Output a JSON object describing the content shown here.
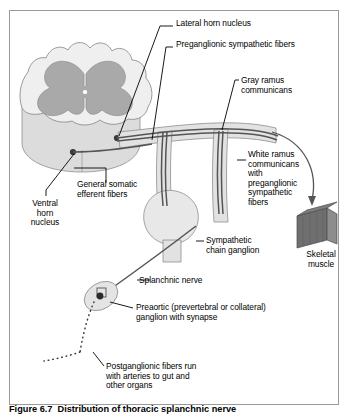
{
  "figure": {
    "caption": "Figure 6.7  Distribution of thoracic splanchnic nerve",
    "border_color": "#9a9a9a",
    "background_color": "#ffffff"
  },
  "colors": {
    "white_matter": "#efefef",
    "gray_matter": "#a9a9a9",
    "cord_side": "#dcdcdc",
    "nerve_trunk": "#e2e2e2",
    "nerve_fiber": "#555555",
    "ganglion_fill": "#e4e4e4",
    "synapse_dot": "#2b2b2b",
    "muscle_dark": "#6f6f6f",
    "muscle_light": "#8d8d8d",
    "leader_line": "#000000"
  },
  "labels": [
    {
      "id": "lateral-horn-nucleus",
      "text": "Lateral horn nucleus",
      "x": 176,
      "y": 19
    },
    {
      "id": "preganglionic-sympathetic-fibers",
      "text": "Preganglionic sympathetic fibers",
      "x": 176,
      "y": 40
    },
    {
      "id": "gray-ramus-communicans",
      "text": "Gray ramus\ncommunicans",
      "x": 241,
      "y": 76
    },
    {
      "id": "white-ramus-communicans",
      "text": "White ramus\ncommunicans\nwith\npreganglionic\nsympathetic\nfibers",
      "x": 248,
      "y": 150
    },
    {
      "id": "general-somatic-efferent-fibers",
      "text": "General somatic\nefferent fibers",
      "x": 77,
      "y": 180
    },
    {
      "id": "ventral-horn-nucleus",
      "text": "Ventral\nhorn\nnucleus",
      "x": 17,
      "y": 199
    },
    {
      "id": "sympathetic-chain-ganglion",
      "text": "Sympathetic\nchain ganglion",
      "x": 206,
      "y": 236
    },
    {
      "id": "skeletal-muscle",
      "text": "Skeletal\nmuscle",
      "x": 297,
      "y": 250
    },
    {
      "id": "splanchnic-nerve",
      "text": "Splanchnic nerve",
      "x": 139,
      "y": 276
    },
    {
      "id": "preaortic-ganglion",
      "text": "Preaortic (prevertebral or collateral)\nganglion with synapse",
      "x": 136,
      "y": 303
    },
    {
      "id": "postganglionic-fibers",
      "text": "Postganglionic fibers run\nwith arteries to gut and\nother organs",
      "x": 106,
      "y": 362
    }
  ],
  "structures": [
    {
      "id": "spinal-cord-cross-section",
      "name": "spinal cord cross section"
    },
    {
      "id": "gray-matter-butterfly",
      "name": "gray matter butterfly"
    },
    {
      "id": "central-canal",
      "name": "central canal"
    },
    {
      "id": "lateral-horn-dot",
      "name": "lateral horn nucleus cell body"
    },
    {
      "id": "ventral-horn-dot",
      "name": "ventral horn nucleus cell body"
    },
    {
      "id": "spinal-nerve-trunk",
      "name": "spinal nerve trunk"
    },
    {
      "id": "sympathetic-chain-ganglion-body",
      "name": "sympathetic chain ganglion"
    },
    {
      "id": "preaortic-ganglion-body",
      "name": "preaortic ganglion"
    },
    {
      "id": "skeletal-muscle-block",
      "name": "skeletal muscle block"
    },
    {
      "id": "postganglionic-dotted-fibers",
      "name": "postganglionic dotted fibers"
    }
  ]
}
